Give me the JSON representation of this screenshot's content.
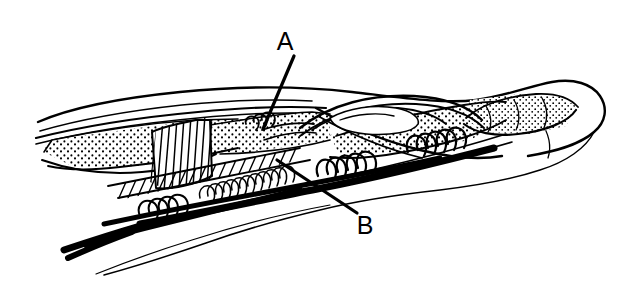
{
  "figure": {
    "kind": "anatomical-line-drawing",
    "background_color": "#ffffff",
    "ink_color": "#000000",
    "width": 629,
    "height": 282
  },
  "labels": [
    {
      "id": "A",
      "text": "A",
      "x": 285,
      "y": 50,
      "leader": {
        "x1": 294,
        "y1": 56,
        "x2": 263,
        "y2": 129
      }
    },
    {
      "id": "B",
      "text": "B",
      "x": 356,
      "y": 234,
      "leader": {
        "x1": 277,
        "y1": 160,
        "x2": 357,
        "y2": 213
      }
    }
  ],
  "structures": {
    "skin_outline_label": "finger-skin-outline",
    "nail_bed_label": "fingertip",
    "stipple_label": "tendon-stippled-texture",
    "hatch_label": "tendon-sheath-hatching",
    "coil_label": "suture-coil-wrap",
    "strand_label": "suture-strand",
    "incision_label": "incision-flap-edge"
  }
}
